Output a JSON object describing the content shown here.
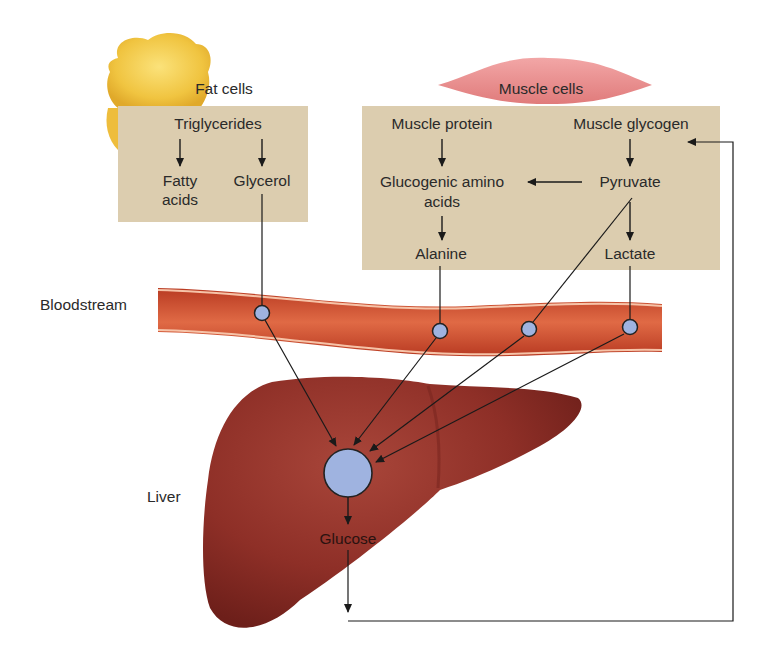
{
  "diagram": {
    "type": "pathway",
    "topic": "Gluconeogenesis sources and glucose recycling between tissues and liver",
    "colors": {
      "fat_panel": "#dcccae",
      "muscle_panel": "#dcccae",
      "bloodstream": "#c84a2c",
      "liver": "#8c2e26",
      "node": "#9fb3e0",
      "line": "#1a1a1a"
    },
    "fat_cells": {
      "title": "Fat cells",
      "triglycerides": "Triglycerides",
      "fatty_acids_l1": "Fatty",
      "fatty_acids_l2": "acids",
      "glycerol": "Glycerol"
    },
    "muscle_cells": {
      "title": "Muscle cells",
      "muscle_protein": "Muscle protein",
      "muscle_glycogen": "Muscle glycogen",
      "glucogenic_l1": "Glucogenic amino",
      "glucogenic_l2": "acids",
      "pyruvate": "Pyruvate",
      "alanine": "Alanine",
      "lactate": "Lactate"
    },
    "bloodstream": {
      "label": "Bloodstream"
    },
    "liver": {
      "label": "Liver",
      "product": "Glucose"
    },
    "edges": [
      {
        "from": "Triglycerides",
        "to": "Fatty acids"
      },
      {
        "from": "Triglycerides",
        "to": "Glycerol"
      },
      {
        "from": "Muscle protein",
        "to": "Glucogenic amino acids"
      },
      {
        "from": "Pyruvate",
        "to": "Glucogenic amino acids"
      },
      {
        "from": "Muscle glycogen",
        "to": "Pyruvate"
      },
      {
        "from": "Glucogenic amino acids",
        "to": "Alanine"
      },
      {
        "from": "Pyruvate",
        "to": "Lactate"
      },
      {
        "from": "Glycerol",
        "to": "Liver",
        "via": "Bloodstream"
      },
      {
        "from": "Alanine",
        "to": "Liver",
        "via": "Bloodstream"
      },
      {
        "from": "Pyruvate",
        "to": "Liver",
        "via": "Bloodstream"
      },
      {
        "from": "Lactate",
        "to": "Liver",
        "via": "Bloodstream"
      },
      {
        "from": "Liver",
        "to": "Glucose"
      },
      {
        "from": "Glucose",
        "to": "Muscle glycogen"
      }
    ]
  }
}
